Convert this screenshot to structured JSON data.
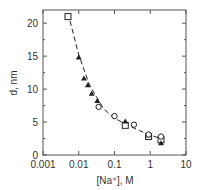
{
  "chart_data": {
    "type": "scatter",
    "title": "",
    "xlabel": "[Na+], M",
    "ylabel": "d, nm",
    "xscale": "log",
    "xlim": [
      0.001,
      10
    ],
    "ylim": [
      0,
      22
    ],
    "x_ticks": [
      "0.001",
      "0.01",
      "0.1",
      "1",
      "10"
    ],
    "y_ticks": [
      "0",
      "5",
      "10",
      "15",
      "20"
    ],
    "grid": false,
    "legend": null,
    "series": [
      {
        "name": "squares",
        "marker": "open-square",
        "points": [
          [
            0.005,
            21.0
          ],
          [
            0.2,
            4.5
          ],
          [
            0.9,
            2.8
          ],
          [
            2.0,
            2.3
          ]
        ]
      },
      {
        "name": "triangles",
        "marker": "filled-triangle",
        "points": [
          [
            0.01,
            14.8
          ],
          [
            0.014,
            11.6
          ],
          [
            0.018,
            10.6
          ],
          [
            0.023,
            9.3
          ],
          [
            0.033,
            8.2
          ],
          [
            0.2,
            5.1
          ],
          [
            0.9,
            3.0
          ],
          [
            2.0,
            1.8
          ]
        ]
      },
      {
        "name": "circles",
        "marker": "open-circle",
        "points": [
          [
            0.036,
            7.3
          ],
          [
            0.1,
            5.9
          ],
          [
            0.35,
            4.6
          ],
          [
            0.9,
            3.1
          ],
          [
            2.0,
            2.8
          ]
        ]
      },
      {
        "name": "fit",
        "style": "dashed-line",
        "points": [
          [
            0.005,
            21.5
          ],
          [
            0.01,
            15.2
          ],
          [
            0.02,
            10.6
          ],
          [
            0.05,
            7.0
          ],
          [
            0.1,
            5.6
          ],
          [
            0.2,
            4.7
          ],
          [
            0.5,
            3.7
          ],
          [
            1.0,
            3.0
          ],
          [
            2.0,
            2.5
          ]
        ]
      }
    ]
  },
  "labels": {
    "x": "[Na⁺], M",
    "y": "d, nm"
  }
}
